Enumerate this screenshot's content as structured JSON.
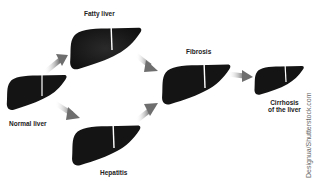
{
  "diagram": {
    "stages": [
      {
        "id": "normal",
        "label": "Normal liver"
      },
      {
        "id": "fatty",
        "label": "Fatty liver"
      },
      {
        "id": "hepatitis",
        "label": "Hepatitis"
      },
      {
        "id": "fibrosis",
        "label": "Fibrosis"
      },
      {
        "id": "cirrhosis",
        "label_line1": "Cirrhosis",
        "label_line2": "of the liver"
      }
    ],
    "edges": [
      {
        "from": "normal",
        "to": "fatty"
      },
      {
        "from": "normal",
        "to": "hepatitis"
      },
      {
        "from": "fatty",
        "to": "fibrosis"
      },
      {
        "from": "hepatitis",
        "to": "fibrosis"
      },
      {
        "from": "fibrosis",
        "to": "cirrhosis"
      }
    ],
    "credit": "Designua/Shutterstock.com",
    "colors": {
      "liver": "#141414",
      "arrow": "#7a7a7a",
      "background": "#ffffff"
    }
  }
}
